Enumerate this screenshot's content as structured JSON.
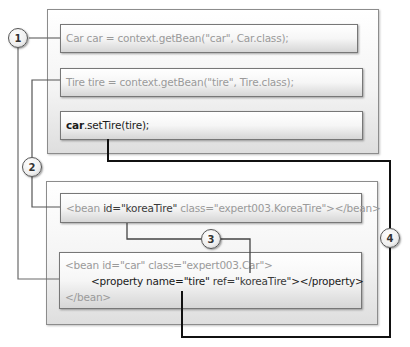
{
  "diagram": {
    "top_panel": {
      "lines": [
        {
          "text": "Car car = context.getBean(\"car\", Car.class);"
        },
        {
          "text": "Tire tire = context.getBean(\"tire\", Tire.class);"
        },
        {
          "text_bold": "car",
          "text_rest": ".setTire(tire);"
        }
      ]
    },
    "bottom_panel": {
      "bean_koreatire": {
        "prefix": "<bean ",
        "id_attr": "id=\"koreaTire\"",
        "rest": " class=\"expert003.KoreaTire\"></bean>"
      },
      "bean_car": {
        "line1": "<bean id=\"car\" class=\"expert003.Car\">",
        "line2_start": "<property name=",
        "line2_name": "\"tire\"",
        "line2_ref": " ref=\"koreaTire\"",
        "line2_end": "></property>",
        "line3": "</bean>"
      }
    },
    "markers": [
      "1",
      "2",
      "3",
      "4"
    ],
    "colors": {
      "line": "#4a4a4a",
      "thick_line": "#111111",
      "text_gray": "#9a9a9a",
      "text_dark": "#1a1a1a"
    }
  }
}
